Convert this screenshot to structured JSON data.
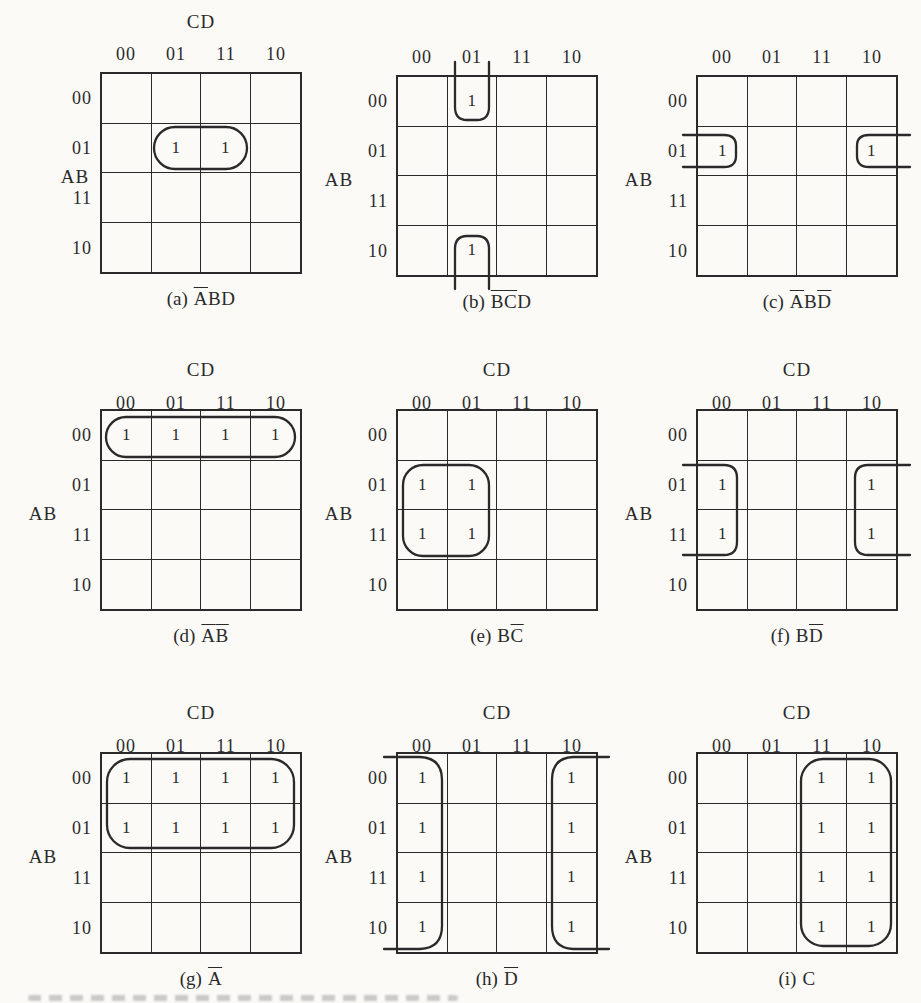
{
  "figure": {
    "type": "karnaugh-maps",
    "paper_color": "#fbfaf7",
    "ink_color": "#2a2a2a"
  },
  "maps": [
    {
      "id": "a",
      "col_axis_label": "CD",
      "row_axis_label": "AB",
      "col_labels": [
        "00",
        "01",
        "11",
        "10"
      ],
      "row_labels": [
        "00",
        "01",
        "11",
        "10"
      ],
      "cells": [
        "",
        "",
        "",
        "",
        "",
        "1",
        "1",
        "",
        "",
        "",
        "",
        "",
        "",
        "",
        "",
        ""
      ],
      "caption_prefix": "(a)",
      "caption_parts": [
        {
          "text": "A",
          "bar": true
        },
        {
          "text": "B",
          "bar": false
        },
        {
          "text": "D",
          "bar": false
        }
      ],
      "loop_group": "pair: AB=01, CD=01,11"
    },
    {
      "id": "b",
      "col_axis_label": "",
      "row_axis_label": "AB",
      "col_labels": [
        "00",
        "01",
        "11",
        "10"
      ],
      "row_labels": [
        "00",
        "01",
        "11",
        "10"
      ],
      "cells": [
        "",
        "1",
        "",
        "",
        "",
        "",
        "",
        "",
        "",
        "",
        "",
        "",
        "",
        "1",
        "",
        ""
      ],
      "caption_prefix": "(b)",
      "caption_parts": [
        {
          "text": "B",
          "bar": true
        },
        {
          "text": "C",
          "bar": true
        },
        {
          "text": "D",
          "bar": false
        }
      ],
      "loop_group": "wrap pair: CD=01, AB=00,10 (top-bottom wrap)"
    },
    {
      "id": "c",
      "col_axis_label": "",
      "row_axis_label": "AB",
      "col_labels": [
        "00",
        "01",
        "11",
        "10"
      ],
      "row_labels": [
        "00",
        "01",
        "11",
        "10"
      ],
      "cells": [
        "",
        "",
        "",
        "",
        "1",
        "",
        "",
        "1",
        "",
        "",
        "",
        "",
        "",
        "",
        "",
        ""
      ],
      "caption_prefix": "(c)",
      "caption_parts": [
        {
          "text": "A",
          "bar": true
        },
        {
          "text": "B",
          "bar": false
        },
        {
          "text": "D",
          "bar": true
        }
      ],
      "loop_group": "wrap pair: AB=01, CD=00,10 (left-right wrap)"
    },
    {
      "id": "d",
      "col_axis_label": "CD",
      "row_axis_label": "AB",
      "col_labels": [
        "00",
        "01",
        "11",
        "10"
      ],
      "row_labels": [
        "00",
        "01",
        "11",
        "10"
      ],
      "cells": [
        "1",
        "1",
        "1",
        "1",
        "",
        "",
        "",
        "",
        "",
        "",
        "",
        "",
        "",
        "",
        "",
        ""
      ],
      "caption_prefix": "(d)",
      "caption_parts": [
        {
          "text": "A",
          "bar": true
        },
        {
          "text": "B",
          "bar": true
        }
      ],
      "loop_group": "quad: row AB=00"
    },
    {
      "id": "e",
      "col_axis_label": "CD",
      "row_axis_label": "AB",
      "col_labels": [
        "00",
        "01",
        "11",
        "10"
      ],
      "row_labels": [
        "00",
        "01",
        "11",
        "10"
      ],
      "cells": [
        "",
        "",
        "",
        "",
        "1",
        "1",
        "",
        "",
        "1",
        "1",
        "",
        "",
        "",
        "",
        "",
        ""
      ],
      "caption_prefix": "(e)",
      "caption_parts": [
        {
          "text": "B",
          "bar": false
        },
        {
          "text": "C",
          "bar": true
        }
      ],
      "loop_group": "quad: AB=01,11 x CD=00,01"
    },
    {
      "id": "f",
      "col_axis_label": "CD",
      "row_axis_label": "AB",
      "col_labels": [
        "00",
        "01",
        "11",
        "10"
      ],
      "row_labels": [
        "00",
        "01",
        "11",
        "10"
      ],
      "cells": [
        "",
        "",
        "",
        "",
        "1",
        "",
        "",
        "1",
        "1",
        "",
        "",
        "1",
        "",
        "",
        "",
        ""
      ],
      "caption_prefix": "(f)",
      "caption_parts": [
        {
          "text": "B",
          "bar": false
        },
        {
          "text": "D",
          "bar": true
        }
      ],
      "loop_group": "wrap quad: AB=01,11 x CD=00,10"
    },
    {
      "id": "g",
      "col_axis_label": "CD",
      "row_axis_label": "AB",
      "col_labels": [
        "00",
        "01",
        "11",
        "10"
      ],
      "row_labels": [
        "00",
        "01",
        "11",
        "10"
      ],
      "cells": [
        "1",
        "1",
        "1",
        "1",
        "1",
        "1",
        "1",
        "1",
        "",
        "",
        "",
        "",
        "",
        "",
        "",
        ""
      ],
      "caption_prefix": "(g)",
      "caption_parts": [
        {
          "text": "A",
          "bar": true
        }
      ],
      "loop_group": "octet: rows AB=00,01"
    },
    {
      "id": "h",
      "col_axis_label": "CD",
      "row_axis_label": "AB",
      "col_labels": [
        "00",
        "01",
        "11",
        "10"
      ],
      "row_labels": [
        "00",
        "01",
        "11",
        "10"
      ],
      "cells": [
        "1",
        "",
        "",
        "1",
        "1",
        "",
        "",
        "1",
        "1",
        "",
        "",
        "1",
        "1",
        "",
        "",
        "1"
      ],
      "caption_prefix": "(h)",
      "caption_parts": [
        {
          "text": "D",
          "bar": true
        }
      ],
      "loop_group": "wrap octet: columns CD=00,10"
    },
    {
      "id": "i",
      "col_axis_label": "CD",
      "row_axis_label": "AB",
      "col_labels": [
        "00",
        "01",
        "11",
        "10"
      ],
      "row_labels": [
        "00",
        "01",
        "11",
        "10"
      ],
      "cells": [
        "",
        "",
        "1",
        "1",
        "",
        "",
        "1",
        "1",
        "",
        "",
        "1",
        "1",
        "",
        "",
        "1",
        "1"
      ],
      "caption_prefix": "(i)",
      "caption_parts": [
        {
          "text": "C",
          "bar": false
        }
      ],
      "loop_group": "octet: columns CD=11,10"
    }
  ]
}
